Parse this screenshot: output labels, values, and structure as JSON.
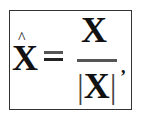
{
  "formula": {
    "latex": "\\hat{\\mathbf{X}} = \\frac{\\mathbf{X}}{|\\mathbf{X}|},",
    "lhs": {
      "symbol": "X",
      "accent": "^"
    },
    "operator": "=",
    "numerator": "X",
    "denominator": {
      "left_bar": "|",
      "symbol": "X",
      "right_bar": "|"
    },
    "trailing_punctuation": ","
  },
  "colors": {
    "text": "#111111",
    "border": "#333333",
    "background": "#ffffff"
  }
}
